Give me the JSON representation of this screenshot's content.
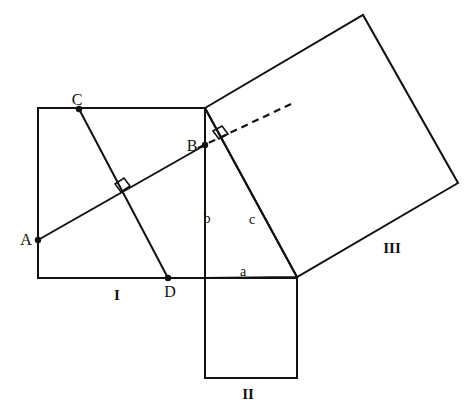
{
  "figure": {
    "stroke_color": "#111111",
    "background_color": "#ffffff",
    "dash_color": "#111111"
  },
  "vertex_labels": [
    {
      "name": "A",
      "text": "A",
      "x": 26,
      "y": 240
    },
    {
      "name": "B",
      "text": "B",
      "x": 192,
      "y": 146
    },
    {
      "name": "C",
      "text": "C",
      "x": 77,
      "y": 100
    },
    {
      "name": "D",
      "text": "D",
      "x": 170,
      "y": 292
    }
  ],
  "side_labels": [
    {
      "name": "a",
      "text": "a",
      "x": 243,
      "y": 272
    },
    {
      "name": "b",
      "text": "b",
      "x": 207,
      "y": 219
    },
    {
      "name": "c",
      "text": "c",
      "x": 252,
      "y": 220
    }
  ],
  "region_labels": [
    {
      "name": "I",
      "text": "I",
      "x": 117,
      "y": 295
    },
    {
      "name": "II",
      "text": "II",
      "x": 248,
      "y": 394
    },
    {
      "name": "III",
      "text": "III",
      "x": 392,
      "y": 248
    }
  ],
  "geometry": {
    "square_I": {
      "points": "38,108 205,108 205,278 38,278"
    },
    "square_II": {
      "points": "205,278 297,278 297,378 205,378"
    },
    "square_III": {
      "points": "205,108 363,15 458,183 297,277"
    },
    "triangle": {
      "points": "205,108 205,278 297,277"
    },
    "line_AB": {
      "x1": 38,
      "y1": 240,
      "x2": 205,
      "y2": 145
    },
    "line_CD": {
      "x1": 79,
      "y1": 109,
      "x2": 168,
      "y2": 278
    },
    "dashed_BE": {
      "x1": 198,
      "y1": 148,
      "x2": 291,
      "y2": 104
    },
    "right_angle_CD_AB": {
      "points": "115,184 124,178 130,186 121,192"
    },
    "right_angle_dashed": {
      "points": "213,131 222,126 228,134 219,139"
    },
    "points": [
      {
        "name": "point-A",
        "cx": 38,
        "cy": 240
      },
      {
        "name": "point-B",
        "cx": 205,
        "cy": 145
      },
      {
        "name": "point-C",
        "cx": 79,
        "cy": 109
      },
      {
        "name": "point-D",
        "cx": 168,
        "cy": 278
      }
    ]
  }
}
